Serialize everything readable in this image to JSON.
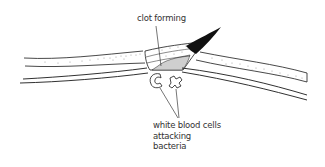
{
  "diagram": {
    "type": "biology-illustration",
    "labels": {
      "clot": "clot forming",
      "wbc_lines": [
        "white blood cells",
        "attacking",
        "bacteria"
      ]
    },
    "colors": {
      "ink": "#1a1a1a",
      "clot_fill": "#cfcfcf",
      "dots": "#8a8a8a",
      "background": "#ffffff",
      "text": "#333333"
    }
  }
}
